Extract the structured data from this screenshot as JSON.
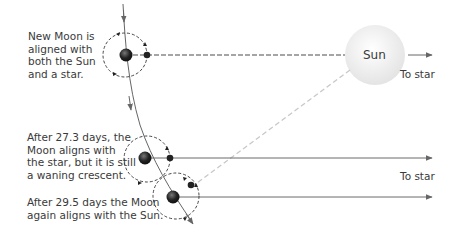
{
  "labels": {
    "new_moon": [
      "New Moon is",
      "aligned with",
      "both the Sun",
      "and a star."
    ],
    "after_27": [
      "After 27.3 days, the",
      "Moon aligns with",
      "the star, but it is still",
      "a waning crescent."
    ],
    "after_29": [
      "After 29.5 days the Moon",
      "again aligns with the Sun."
    ],
    "sun": "Sun",
    "to_star_top": "To star",
    "to_star_bottom": "To star"
  },
  "colors": {
    "line": "#6a6a6a",
    "dashed_light": "#c8c8c8",
    "sun_fill": "#eeeeee",
    "earth": "#222222"
  }
}
